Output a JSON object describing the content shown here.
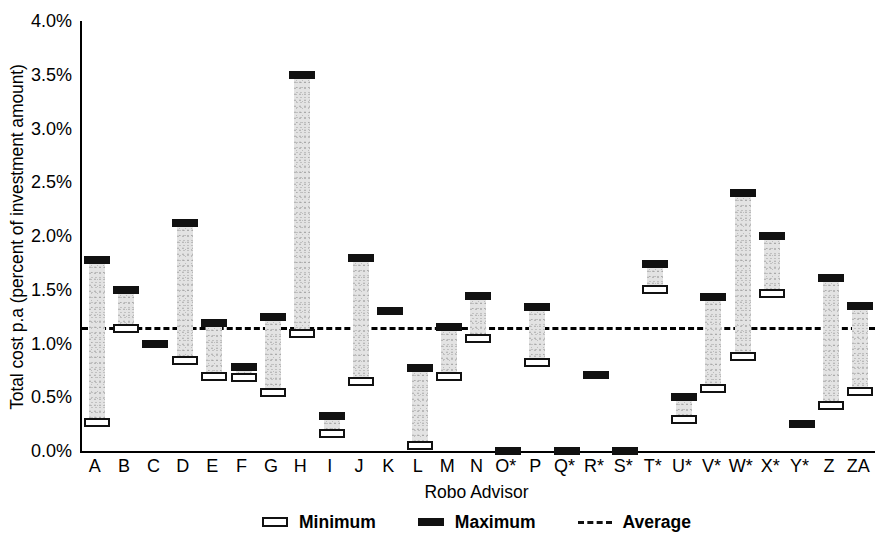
{
  "chart_data": {
    "type": "bar",
    "title": "",
    "xlabel": "Robo Advisor",
    "ylabel": "Total cost p.a (percent of investment amount)",
    "ylim": [
      0.0,
      4.0
    ],
    "yunit": "%",
    "ytick_labels": [
      "4.0%",
      "3.5%",
      "3.0%",
      "2.5%",
      "2.0%",
      "1.5%",
      "1.0%",
      "0.5%",
      "0.0%"
    ],
    "ytick_values": [
      4.0,
      3.5,
      3.0,
      2.5,
      2.0,
      1.5,
      1.0,
      0.5,
      0.0
    ],
    "grid": false,
    "categories": [
      "A",
      "B",
      "C",
      "D",
      "E",
      "F",
      "G",
      "H",
      "I",
      "J",
      "K",
      "L",
      "M",
      "N",
      "O*",
      "P",
      "Q*",
      "R*",
      "S*",
      "T*",
      "U*",
      "V*",
      "W*",
      "X*",
      "Y*",
      "Z",
      "ZA"
    ],
    "series": [
      {
        "name": "Minimum",
        "values": [
          0.27,
          1.14,
          1.0,
          0.85,
          0.7,
          0.69,
          0.55,
          1.1,
          0.17,
          0.65,
          1.3,
          0.06,
          0.7,
          1.05,
          0.0,
          0.83,
          0.0,
          0.71,
          0.0,
          1.51,
          0.3,
          0.59,
          0.88,
          1.47,
          0.25,
          0.43,
          0.56
        ]
      },
      {
        "name": "Maximum",
        "values": [
          1.78,
          1.5,
          1.0,
          2.12,
          1.19,
          0.78,
          1.25,
          3.5,
          0.33,
          1.8,
          1.3,
          0.77,
          1.15,
          1.44,
          0.0,
          1.34,
          0.0,
          0.71,
          0.0,
          1.74,
          0.5,
          1.43,
          2.4,
          2.0,
          0.25,
          1.61,
          1.35
        ]
      }
    ],
    "average": {
      "name": "Average",
      "value": 1.15
    },
    "legend": {
      "position": "bottom",
      "entries": [
        {
          "label": "Minimum",
          "marker": "open-rect"
        },
        {
          "label": "Maximum",
          "marker": "filled-rect"
        },
        {
          "label": "Average",
          "marker": "dashed-line"
        }
      ]
    }
  }
}
